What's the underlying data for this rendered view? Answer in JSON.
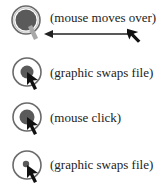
{
  "diagram": {
    "steps": [
      {
        "label": "(mouse moves over)",
        "state": "over",
        "icon": "rollover-button-icon"
      },
      {
        "label": "(graphic swaps file)",
        "state": "over-graphic",
        "icon": "button-hover-icon"
      },
      {
        "label": "(mouse click)",
        "state": "down",
        "icon": "button-click-icon"
      },
      {
        "label": "(graphic swaps file)",
        "state": "down-graphic",
        "icon": "button-pressed-icon"
      }
    ],
    "colors": {
      "ring": "#6a6a6a",
      "fill_dark": "#5a5a5a",
      "highlight": "#a8a8a8",
      "cursor": "#111111",
      "text": "#222222"
    }
  }
}
